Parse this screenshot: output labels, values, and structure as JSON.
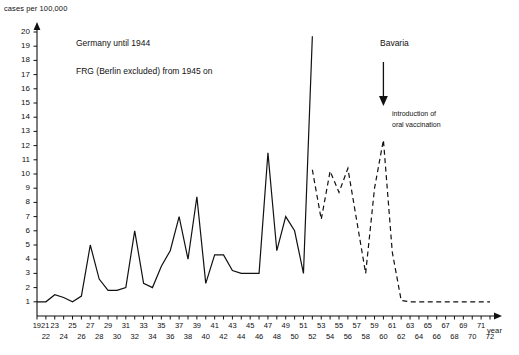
{
  "chart_data": {
    "type": "line",
    "title": "",
    "ylabel": "cases per 100,000",
    "xlabel": "year",
    "ylim": [
      0,
      20
    ],
    "y_ticks": [
      1,
      2,
      3,
      4,
      5,
      6,
      7,
      8,
      9,
      10,
      11,
      12,
      13,
      14,
      15,
      16,
      17,
      18,
      19,
      20
    ],
    "x_ticks_top": [
      "1921",
      "23",
      "25",
      "27",
      "29",
      "31",
      "33",
      "35",
      "37",
      "39",
      "41",
      "43",
      "45",
      "47",
      "49",
      "51",
      "53",
      "55",
      "57",
      "59",
      "61",
      "63",
      "65",
      "67",
      "69",
      "71"
    ],
    "x_ticks_bottom": [
      "22",
      "24",
      "26",
      "28",
      "30",
      "32",
      "34",
      "36",
      "38",
      "40",
      "42",
      "44",
      "46",
      "48",
      "50",
      "52",
      "54",
      "56",
      "58",
      "60",
      "62",
      "64",
      "66",
      "68",
      "70",
      "72"
    ],
    "grid": false,
    "legend_position": "none",
    "annotations": [
      {
        "id": "germany_note",
        "text": "Germany until 1944"
      },
      {
        "id": "frg_note",
        "text": "FRG (Berlin excluded) from 1945 on"
      },
      {
        "id": "bavaria_note",
        "text": "Bavaria"
      },
      {
        "id": "vaccination_note_line1",
        "text": "introduction of"
      },
      {
        "id": "vaccination_note_line2",
        "text": "oral vaccination"
      }
    ],
    "series": [
      {
        "name": "Germany / FRG (solid)",
        "style": "solid",
        "x": [
          1921,
          1922,
          1923,
          1924,
          1925,
          1926,
          1927,
          1928,
          1929,
          1930,
          1931,
          1932,
          1933,
          1934,
          1935,
          1936,
          1937,
          1938,
          1939,
          1940,
          1941,
          1942,
          1943,
          1944,
          1945,
          1946,
          1947,
          1948,
          1949,
          1950,
          1951,
          1952
        ],
        "y": [
          1.0,
          1.0,
          1.5,
          1.3,
          1.0,
          1.4,
          5.0,
          2.6,
          1.8,
          1.8,
          2.0,
          6.0,
          2.3,
          2.0,
          3.5,
          4.6,
          7.0,
          4.0,
          8.4,
          2.3,
          4.3,
          4.3,
          3.2,
          3.0,
          3.0,
          3.0,
          11.5,
          4.6,
          7.0,
          6.0,
          3.0,
          19.7
        ]
      },
      {
        "name": "Bavaria (dashed)",
        "style": "dashed",
        "x": [
          1952,
          1953,
          1954,
          1955,
          1956,
          1957,
          1958,
          1959,
          1960,
          1961,
          1962,
          1963,
          1964,
          1965,
          1966,
          1967,
          1968,
          1969,
          1970,
          1971,
          1972
        ],
        "y": [
          10.3,
          6.8,
          10.2,
          8.7,
          10.4,
          6.7,
          3.0,
          9.0,
          12.4,
          4.5,
          1.1,
          1.0,
          1.0,
          1.0,
          1.0,
          1.0,
          1.0,
          1.0,
          1.0,
          1.0,
          1.0
        ]
      }
    ],
    "arrow": {
      "x_year": 1960,
      "label": "introduction of oral vaccination"
    }
  }
}
